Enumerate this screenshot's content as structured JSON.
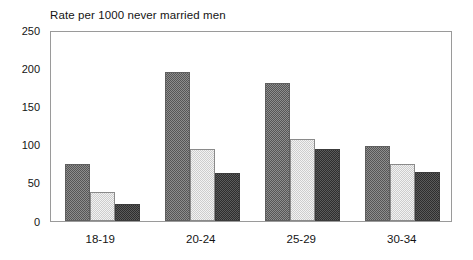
{
  "chart_data": {
    "type": "bar",
    "title": "Rate per 1000 never married men",
    "subtitle": "",
    "xlabel": "",
    "ylabel": "",
    "categories": [
      "18-19",
      "20-24",
      "25-29",
      "30-34"
    ],
    "series": [
      {
        "name": "series-1",
        "values": [
          75,
          197,
          182,
          99
        ],
        "color": "#8d8d8d"
      },
      {
        "name": "series-2",
        "values": [
          39,
          95,
          109,
          76
        ],
        "color": "#f2f2f2"
      },
      {
        "name": "series-3",
        "values": [
          22,
          63,
          95,
          65
        ],
        "color": "#5a5a5a"
      }
    ],
    "ylim": [
      0,
      250
    ],
    "ytick_labels": [
      "250",
      "200",
      "150",
      "100",
      "50",
      "0"
    ],
    "ytick_values": [
      250,
      200,
      150,
      100,
      50,
      0
    ],
    "grid": false,
    "legend": "none",
    "plot_background": "#ffffff",
    "frame_color": "#9a9a9a"
  }
}
